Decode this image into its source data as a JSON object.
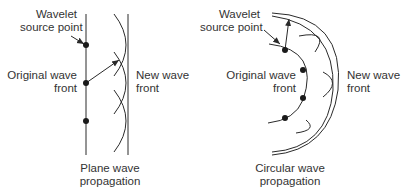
{
  "diagrams": [
    {
      "id": "plane",
      "source_label": [
        "Wavelet",
        "source point"
      ],
      "original_label": [
        "Original wave",
        "front"
      ],
      "new_label": [
        "New wave",
        "front"
      ],
      "caption": [
        "Plane wave",
        "propagation"
      ]
    },
    {
      "id": "circular",
      "source_label": [
        "Wavelet",
        "source point"
      ],
      "original_label": [
        "Original wave",
        "front"
      ],
      "new_label": [
        "New wave",
        "front"
      ],
      "caption": [
        "Circular wave",
        "propagation"
      ]
    }
  ],
  "colors": {
    "line": "#2a2a2a",
    "text": "#333333"
  }
}
